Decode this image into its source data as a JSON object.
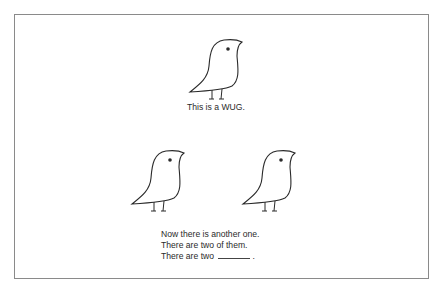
{
  "figure": {
    "caption_top": "This is a WUG.",
    "caption_bottom": {
      "line1": "Now there is another one.",
      "line2": "There are two of them.",
      "line3_prefix": "There are two",
      "line3_suffix": "."
    },
    "birds": [
      {
        "name": "wug-1"
      },
      {
        "name": "wug-2"
      },
      {
        "name": "wug-3"
      }
    ],
    "colors": {
      "stroke": "#2a2a2a",
      "border": "#8a8a8a",
      "background": "#ffffff"
    }
  }
}
